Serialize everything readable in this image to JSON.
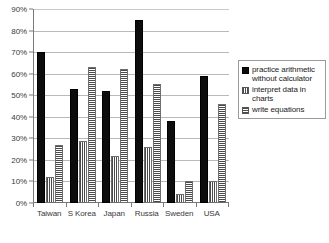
{
  "chart_data": {
    "type": "bar",
    "title": "",
    "xlabel": "",
    "ylabel": "",
    "categories": [
      "Taiwan",
      "S Korea",
      "Japan",
      "Russia",
      "Sweden",
      "USA"
    ],
    "series": [
      {
        "name": "practice arithmetic without calculator",
        "pattern": "solid-black",
        "values": [
          70,
          53,
          52,
          85,
          38,
          59
        ]
      },
      {
        "name": "interpret data in charts",
        "pattern": "vertical-stripes",
        "values": [
          12,
          29,
          22,
          26,
          4,
          10
        ]
      },
      {
        "name": "write equations",
        "pattern": "horizontal-stripes",
        "values": [
          27,
          63,
          62,
          55,
          10,
          46
        ]
      }
    ],
    "ylim": [
      0,
      90
    ],
    "y_tick_labels": [
      "0%",
      "10%",
      "20%",
      "30%",
      "40%",
      "50%",
      "60%",
      "70%",
      "80%",
      "90%"
    ],
    "y_tick_values": [
      0,
      10,
      20,
      30,
      40,
      50,
      60,
      70,
      80,
      90
    ],
    "grid": true,
    "legend_position": "right",
    "value_suffix": "%"
  },
  "legend": {
    "items": [
      {
        "label": "practice arithmetic without calculator"
      },
      {
        "label": "interpret data in charts"
      },
      {
        "label": "write equations"
      }
    ]
  }
}
